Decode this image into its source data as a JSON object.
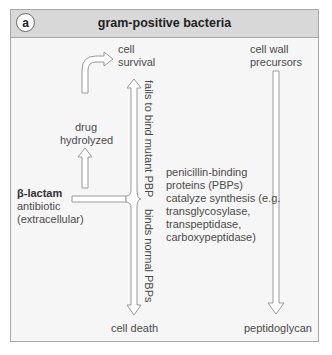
{
  "panel": {
    "badge": "a",
    "title": "gram-positive bacteria"
  },
  "labels": {
    "cell_survival_1": "cell",
    "cell_survival_2": "survival",
    "drug_hydrolyzed_1": "drug",
    "drug_hydrolyzed_2": "hydrolyzed",
    "beta_lactam_1": "β-lactam",
    "beta_lactam_2": "antibiotic",
    "beta_lactam_3": "(extracellular)",
    "cell_death": "cell death",
    "precursors_1": "cell wall",
    "precursors_2": "precursors",
    "peptidoglycan": "peptidoglycan",
    "pbp_1": "penicillin-binding",
    "pbp_2": "proteins (PBPs)",
    "pbp_3": "catalyze synthesis (e.g.",
    "pbp_4": "transglycosylase,",
    "pbp_5": "transpeptidase,",
    "pbp_6": "carboxypeptidase)",
    "fails_to_bind": "fails to bind mutant PBP",
    "binds_normal": "binds normal PBPs"
  },
  "colors": {
    "header_bg": "#d8d8d8",
    "panel_bg": "#f6f6f6",
    "border": "#a8a8a8",
    "arrow_stroke": "#9a9a9a"
  }
}
